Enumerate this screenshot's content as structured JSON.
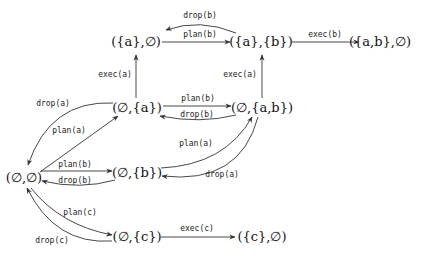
{
  "diagram": {
    "type": "state-transition-graph",
    "nodes": {
      "n_empty_empty": {
        "label": "(∅,∅)",
        "x": 20,
        "y": 182
      },
      "n_empty_a": {
        "label": "(∅,{a})",
        "x": 136,
        "y": 107
      },
      "n_a_empty": {
        "label": "({a},∅)",
        "x": 136,
        "y": 42
      },
      "n_a_b": {
        "label": "({a},{b})",
        "x": 261,
        "y": 42
      },
      "n_ab_empty": {
        "label": "({a,b},∅)",
        "x": 390,
        "y": 42
      },
      "n_empty_ab": {
        "label": "(∅,{a,b})",
        "x": 261,
        "y": 107
      },
      "n_empty_b": {
        "label": "(∅,{b})",
        "x": 136,
        "y": 171
      },
      "n_empty_c": {
        "label": "(∅,{c})",
        "x": 136,
        "y": 240
      },
      "n_c_empty": {
        "label": "({c},∅)",
        "x": 261,
        "y": 240
      }
    },
    "edges": [
      {
        "from": "({a},{b})",
        "to": "({a},∅)",
        "label": "drop(b)"
      },
      {
        "from": "({a},∅)",
        "to": "({a},{b})",
        "label": "plan(b)"
      },
      {
        "from": "({a},{b})",
        "to": "({a,b},∅)",
        "label": "exec(b)"
      },
      {
        "from": "(∅,{a})",
        "to": "({a},∅)",
        "label": "exec(a)"
      },
      {
        "from": "(∅,{a,b})",
        "to": "({a},{b})",
        "label": "exec(a)"
      },
      {
        "from": "(∅,{a})",
        "to": "(∅,{a,b})",
        "label": "plan(b)"
      },
      {
        "from": "(∅,{a,b})",
        "to": "(∅,{a})",
        "label": "drop(b)"
      },
      {
        "from": "(∅,{a})",
        "to": "(∅,∅)",
        "label": "drop(a)"
      },
      {
        "from": "(∅,∅)",
        "to": "(∅,{a})",
        "label": "plan(a)"
      },
      {
        "from": "(∅,{b})",
        "to": "(∅,{a,b})",
        "label": "plan(a)"
      },
      {
        "from": "(∅,{a,b})",
        "to": "(∅,{b})",
        "label": "drop(a)"
      },
      {
        "from": "(∅,∅)",
        "to": "(∅,{b})",
        "label": "plan(b)"
      },
      {
        "from": "(∅,{b})",
        "to": "(∅,∅)",
        "label": "drop(b)"
      },
      {
        "from": "(∅,∅)",
        "to": "(∅,{c})",
        "label": "plan(c)"
      },
      {
        "from": "(∅,{c})",
        "to": "(∅,∅)",
        "label": "drop(c)"
      },
      {
        "from": "(∅,{c})",
        "to": "({c},∅)",
        "label": "exec(c)"
      }
    ],
    "labels": {
      "drop_b_top": "drop(b)",
      "plan_b_top": "plan(b)",
      "exec_b": "exec(b)",
      "exec_a_left": "exec(a)",
      "exec_a_right": "exec(a)",
      "plan_b_mid": "plan(b)",
      "drop_b_mid": "drop(b)",
      "drop_a_left": "drop(a)",
      "plan_a_left": "plan(a)",
      "plan_a_right": "plan(a)",
      "drop_a_right": "drop(a)",
      "plan_b_low": "plan(b)",
      "drop_b_low": "drop(b)",
      "plan_c": "plan(c)",
      "drop_c": "drop(c)",
      "exec_c": "exec(c)"
    }
  }
}
